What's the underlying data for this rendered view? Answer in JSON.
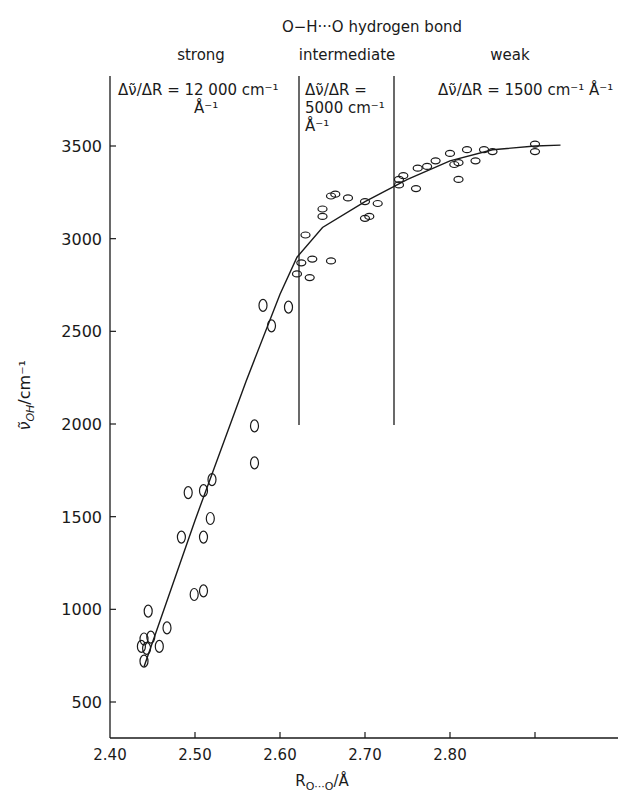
{
  "chart_data": {
    "type": "scatter",
    "xlabel": "R_O···O / Å",
    "ylabel": "ν̃_OH / cm⁻¹",
    "xlim": [
      2.4,
      2.93
    ],
    "ylim": [
      300,
      3700
    ],
    "x_ticks": [
      "2.40",
      "2.50",
      "2.60",
      "2.70",
      "2.80",
      ""
    ],
    "x_tick_values": [
      2.4,
      2.5,
      2.6,
      2.7,
      2.8,
      2.9
    ],
    "y_ticks": [
      "500",
      "1000",
      "1500",
      "2000",
      "2500",
      "3000",
      "3500"
    ],
    "y_tick_values": [
      500,
      1000,
      1500,
      2000,
      2500,
      3000,
      3500
    ],
    "grid": false,
    "regions": [
      {
        "name": "strong",
        "range": [
          2.4,
          2.6
        ],
        "annotation": "Δν̃/ΔR = 12 000 cm⁻¹ Å⁻¹"
      },
      {
        "name": "intermediate",
        "range": [
          2.6,
          2.7
        ],
        "annotation": "Δν̃/ΔR = 5000 cm⁻¹ Å⁻¹"
      },
      {
        "name": "weak",
        "range": [
          2.7,
          2.93
        ],
        "annotation": "Δν̃/ΔR = 1500 cm⁻¹ Å⁻¹"
      }
    ],
    "region_dividers_x": [
      2.6,
      2.7
    ],
    "series": [
      {
        "name": "measured",
        "marker": "open-ellipse",
        "points": [
          [
            2.437,
            800
          ],
          [
            2.44,
            840
          ],
          [
            2.44,
            720
          ],
          [
            2.443,
            790
          ],
          [
            2.445,
            990
          ],
          [
            2.448,
            850
          ],
          [
            2.458,
            800
          ],
          [
            2.467,
            900
          ],
          [
            2.484,
            1390
          ],
          [
            2.492,
            1630
          ],
          [
            2.499,
            1080
          ],
          [
            2.51,
            1100
          ],
          [
            2.51,
            1390
          ],
          [
            2.51,
            1640
          ],
          [
            2.518,
            1490
          ],
          [
            2.52,
            1700
          ],
          [
            2.57,
            1990
          ],
          [
            2.57,
            1790
          ],
          [
            2.58,
            2640
          ],
          [
            2.59,
            2530
          ],
          [
            2.61,
            2630
          ],
          [
            2.62,
            2810
          ],
          [
            2.625,
            2870
          ],
          [
            2.63,
            3020
          ],
          [
            2.635,
            2790
          ],
          [
            2.638,
            2890
          ],
          [
            2.65,
            3120
          ],
          [
            2.65,
            3160
          ],
          [
            2.66,
            2880
          ],
          [
            2.66,
            3230
          ],
          [
            2.665,
            3240
          ],
          [
            2.68,
            3220
          ],
          [
            2.7,
            3200
          ],
          [
            2.7,
            3110
          ],
          [
            2.705,
            3120
          ],
          [
            2.715,
            3190
          ],
          [
            2.74,
            3290
          ],
          [
            2.74,
            3320
          ],
          [
            2.745,
            3340
          ],
          [
            2.76,
            3270
          ],
          [
            2.762,
            3380
          ],
          [
            2.773,
            3390
          ],
          [
            2.783,
            3420
          ],
          [
            2.8,
            3460
          ],
          [
            2.805,
            3400
          ],
          [
            2.81,
            3410
          ],
          [
            2.81,
            3320
          ],
          [
            2.82,
            3480
          ],
          [
            2.83,
            3420
          ],
          [
            2.84,
            3480
          ],
          [
            2.85,
            3470
          ],
          [
            2.9,
            3510
          ],
          [
            2.9,
            3470
          ]
        ]
      },
      {
        "name": "fit",
        "type": "line",
        "points": [
          [
            2.44,
            690
          ],
          [
            2.5,
            1480
          ],
          [
            2.56,
            2230
          ],
          [
            2.6,
            2700
          ],
          [
            2.62,
            2900
          ],
          [
            2.65,
            3060
          ],
          [
            2.7,
            3200
          ],
          [
            2.75,
            3320
          ],
          [
            2.8,
            3420
          ],
          [
            2.85,
            3480
          ],
          [
            2.9,
            3500
          ],
          [
            2.93,
            3505
          ]
        ]
      }
    ]
  },
  "labels": {
    "title": "O−H···O hydrogen bond",
    "region_strong": "strong",
    "region_intermediate": "intermediate",
    "region_weak": "weak",
    "slope_strong_line1": "Δν̃/ΔR = 12 000 cm⁻¹",
    "slope_strong_line2": "Å⁻¹",
    "slope_intermediate_line1": "Δν̃/ΔR =",
    "slope_intermediate_line2": "5000 cm⁻¹",
    "slope_intermediate_line3": "Å⁻¹",
    "slope_weak": "Δν̃/ΔR = 1500 cm⁻¹ Å⁻¹",
    "xlabel": "R",
    "xlabel_sub": "O···O",
    "xlabel_unit": "/Å",
    "ylabel": "ν̃",
    "ylabel_sub": "OH",
    "ylabel_unit": "/cm⁻¹",
    "x_ticks": [
      "2.40",
      "2.50",
      "2.60",
      "2.70",
      "2.80"
    ],
    "y_ticks": [
      "3500",
      "3000",
      "2500",
      "2000",
      "1500",
      "1000",
      "500"
    ]
  }
}
